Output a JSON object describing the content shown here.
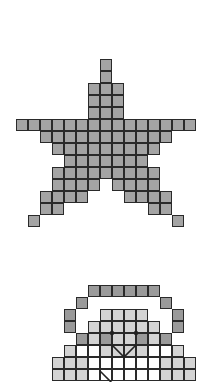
{
  "grid": {
    "cell_size": 12,
    "origin_x": 16
  },
  "colors": {
    "star_fill": "#a4a4a4",
    "dark_fill": "#9a9a9a",
    "light_fill": "#d4d4d4",
    "white_fill": "#ffffff",
    "line": "#222222",
    "background": "#ffffff"
  },
  "star": {
    "top": 59,
    "rows": [
      [
        [
          7,
          7
        ]
      ],
      [
        [
          7,
          7
        ]
      ],
      [
        [
          6,
          8
        ]
      ],
      [
        [
          6,
          8
        ]
      ],
      [
        [
          6,
          8
        ]
      ],
      [
        [
          0,
          14
        ]
      ],
      [
        [
          2,
          12
        ]
      ],
      [
        [
          3,
          11
        ]
      ],
      [
        [
          4,
          10
        ]
      ],
      [
        [
          3,
          11
        ]
      ],
      [
        [
          3,
          6
        ],
        [
          8,
          11
        ]
      ],
      [
        [
          2,
          5
        ],
        [
          9,
          12
        ]
      ],
      [
        [
          2,
          3
        ],
        [
          11,
          12
        ]
      ],
      [
        [
          1,
          1
        ],
        [
          13,
          13
        ]
      ]
    ]
  },
  "partial_figure": {
    "top": 285,
    "rows": [
      {
        "cells": [
          [
            6,
            "d"
          ],
          [
            7,
            "d"
          ],
          [
            8,
            "d"
          ],
          [
            9,
            "d"
          ],
          [
            10,
            "d"
          ],
          [
            11,
            "d"
          ]
        ]
      },
      {
        "cells": [
          [
            5,
            "d"
          ],
          [
            12,
            "d"
          ]
        ]
      },
      {
        "cells": [
          [
            4,
            "d"
          ],
          [
            7,
            "l"
          ],
          [
            8,
            "l"
          ],
          [
            9,
            "l"
          ],
          [
            10,
            "l"
          ],
          [
            13,
            "d"
          ]
        ]
      },
      {
        "cells": [
          [
            4,
            "d"
          ],
          [
            6,
            "l"
          ],
          [
            7,
            "l"
          ],
          [
            8,
            "l"
          ],
          [
            9,
            "l"
          ],
          [
            10,
            "l"
          ],
          [
            11,
            "l"
          ],
          [
            13,
            "d"
          ]
        ]
      },
      {
        "cells": [
          [
            5,
            "d"
          ],
          [
            6,
            "l"
          ],
          [
            7,
            "d"
          ],
          [
            8,
            "l"
          ],
          [
            9,
            "l"
          ],
          [
            10,
            "d"
          ],
          [
            11,
            "l"
          ],
          [
            12,
            "d"
          ]
        ]
      },
      {
        "cells": [
          [
            4,
            "l"
          ],
          [
            5,
            "w"
          ],
          [
            6,
            "w"
          ],
          [
            7,
            "l"
          ],
          [
            8,
            "l"
          ],
          [
            9,
            "l"
          ],
          [
            10,
            "l"
          ],
          [
            11,
            "w"
          ],
          [
            12,
            "w"
          ],
          [
            13,
            "l"
          ]
        ]
      },
      {
        "cells": [
          [
            3,
            "l"
          ],
          [
            4,
            "l"
          ],
          [
            5,
            "l"
          ],
          [
            6,
            "w"
          ],
          [
            7,
            "w"
          ],
          [
            8,
            "w"
          ],
          [
            9,
            "w"
          ],
          [
            10,
            "w"
          ],
          [
            11,
            "w"
          ],
          [
            12,
            "l"
          ],
          [
            13,
            "l"
          ],
          [
            14,
            "l"
          ]
        ]
      },
      {
        "cells": [
          [
            3,
            "l"
          ],
          [
            4,
            "l"
          ],
          [
            5,
            "l"
          ],
          [
            6,
            "w"
          ],
          [
            7,
            "w"
          ],
          [
            8,
            "w"
          ],
          [
            9,
            "w"
          ],
          [
            10,
            "w"
          ],
          [
            11,
            "w"
          ],
          [
            12,
            "l"
          ],
          [
            13,
            "l"
          ],
          [
            14,
            "l"
          ]
        ]
      }
    ],
    "eyes": [
      [
        112,
        333
      ],
      [
        136,
        333
      ]
    ],
    "mouth": [
      [
        112,
        345
      ],
      [
        124,
        357
      ],
      [
        136,
        345
      ]
    ],
    "diagonal": [
      [
        100,
        371
      ],
      [
        112,
        383
      ]
    ]
  }
}
